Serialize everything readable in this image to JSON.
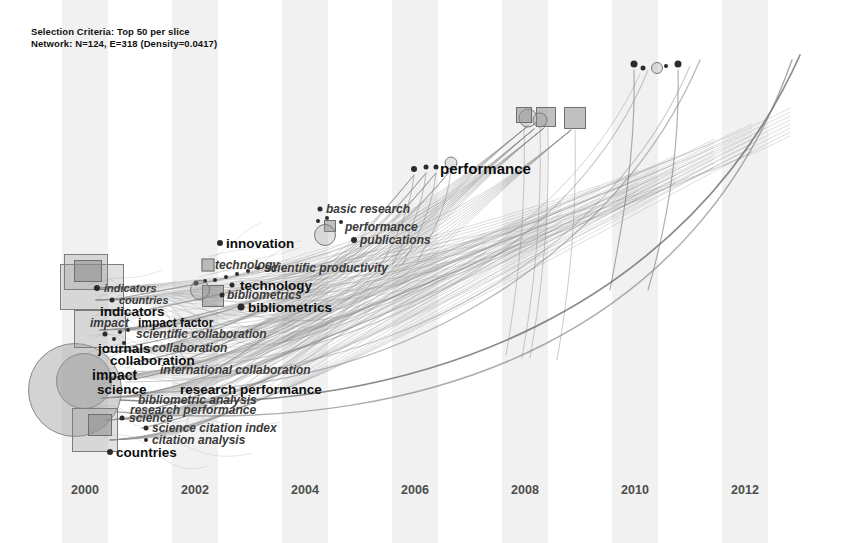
{
  "figure": {
    "kind": "citespace-timeline-network",
    "width": 862,
    "height": 543,
    "background": "#ffffff",
    "band_color": "#f1f1f1",
    "edge_color": "#8c8c8c",
    "node_color": "#8c8c8c",
    "label_color": "#1b1b1b"
  },
  "header": {
    "line1": "Selection Criteria: Top 50 per slice",
    "line2": "Network: N=124, E=318 (Density=0.0417)"
  },
  "chart_data": {
    "type": "scatter",
    "title": "",
    "xlabel": "",
    "ylabel": "",
    "grid": false,
    "legend": "none",
    "xlim": [
      1999,
      2013
    ],
    "axis_years": [
      "2000",
      "2002",
      "2004",
      "2006",
      "2008",
      "2010",
      "2012"
    ],
    "year_x": [
      85,
      195,
      305,
      415,
      525,
      635,
      745
    ],
    "bands": [
      {
        "label": "2000",
        "x": 62,
        "width": 46
      },
      {
        "label": "2002",
        "x": 172,
        "width": 46
      },
      {
        "label": "2004",
        "x": 282,
        "width": 46
      },
      {
        "label": "2006",
        "x": 392,
        "width": 46
      },
      {
        "label": "2008",
        "x": 502,
        "width": 46
      },
      {
        "label": "2010",
        "x": 612,
        "width": 46
      },
      {
        "label": "2012",
        "x": 722,
        "width": 46
      }
    ],
    "labels": [
      {
        "text": "indicators",
        "x": 104,
        "y": 288,
        "size": 11,
        "style": "italic"
      },
      {
        "text": "countries",
        "x": 119,
        "y": 300,
        "size": 11,
        "style": "italic"
      },
      {
        "text": "indicators",
        "x": 100,
        "y": 311,
        "size": 13.5,
        "style": "bold"
      },
      {
        "text": "impact",
        "x": 90,
        "y": 323,
        "size": 12,
        "style": "italic"
      },
      {
        "text": "impact factor",
        "x": 138,
        "y": 323,
        "size": 12,
        "style": "bold"
      },
      {
        "text": "scientific collaboration",
        "x": 136,
        "y": 334,
        "size": 12,
        "style": "italic"
      },
      {
        "text": "journals",
        "x": 98,
        "y": 348,
        "size": 13.5,
        "style": "bold"
      },
      {
        "text": "collaboration",
        "x": 152,
        "y": 348,
        "size": 12,
        "style": "italic"
      },
      {
        "text": "collaboration",
        "x": 110,
        "y": 360,
        "size": 13.5,
        "style": "bold"
      },
      {
        "text": "impact",
        "x": 92,
        "y": 375,
        "size": 14,
        "style": "bold"
      },
      {
        "text": "international collaboration",
        "x": 160,
        "y": 370,
        "size": 12,
        "style": "italic"
      },
      {
        "text": "science",
        "x": 97,
        "y": 389,
        "size": 13.5,
        "style": "bold"
      },
      {
        "text": "research performance",
        "x": 180,
        "y": 389,
        "size": 13.5,
        "style": "bold"
      },
      {
        "text": "bibliometric analysis",
        "x": 138,
        "y": 400,
        "size": 12,
        "style": "italic"
      },
      {
        "text": "research performance",
        "x": 130,
        "y": 410,
        "size": 12,
        "style": "italic"
      },
      {
        "text": "science",
        "x": 129,
        "y": 418,
        "size": 12,
        "style": "italic"
      },
      {
        "text": "science citation index",
        "x": 152,
        "y": 428,
        "size": 12,
        "style": "italic"
      },
      {
        "text": "citation analysis",
        "x": 152,
        "y": 440,
        "size": 12,
        "style": "italic"
      },
      {
        "text": "countries",
        "x": 116,
        "y": 452,
        "size": 13.5,
        "style": "bold"
      },
      {
        "text": "technology",
        "x": 215,
        "y": 265,
        "size": 12,
        "style": "italic"
      },
      {
        "text": "technology",
        "x": 240,
        "y": 285,
        "size": 13.5,
        "style": "bold"
      },
      {
        "text": "bibliometrics",
        "x": 227,
        "y": 295,
        "size": 12,
        "style": "italic"
      },
      {
        "text": "bibliometrics",
        "x": 248,
        "y": 307,
        "size": 13.5,
        "style": "bold"
      },
      {
        "text": "innovation",
        "x": 226,
        "y": 243,
        "size": 13.5,
        "style": "bold"
      },
      {
        "text": "scientific productivity",
        "x": 264,
        "y": 268,
        "size": 12,
        "style": "italic"
      },
      {
        "text": "basic research",
        "x": 326,
        "y": 209,
        "size": 12,
        "style": "italic"
      },
      {
        "text": "performance",
        "x": 345,
        "y": 227,
        "size": 12,
        "style": "italic"
      },
      {
        "text": "publications",
        "x": 360,
        "y": 240,
        "size": 12,
        "style": "italic"
      },
      {
        "text": "performance",
        "x": 440,
        "y": 168,
        "size": 15,
        "style": "bold"
      }
    ],
    "nodes": [
      {
        "shape": "blob",
        "x": 75,
        "y": 390,
        "w": 92,
        "h": 92
      },
      {
        "shape": "blob",
        "x": 84,
        "y": 381,
        "w": 54,
        "h": 54
      },
      {
        "shape": "rect",
        "x": 92,
        "y": 287,
        "w": 62,
        "h": 44
      },
      {
        "shape": "rect",
        "x": 86,
        "y": 272,
        "w": 42,
        "h": 34
      },
      {
        "shape": "sq",
        "x": 88,
        "y": 271,
        "w": 26,
        "h": 20
      },
      {
        "shape": "rect",
        "x": 100,
        "y": 329,
        "w": 50,
        "h": 36
      },
      {
        "shape": "rect",
        "x": 95,
        "y": 430,
        "w": 44,
        "h": 42
      },
      {
        "shape": "sq",
        "x": 100,
        "y": 425,
        "w": 22,
        "h": 20
      },
      {
        "shape": "dot",
        "x": 97,
        "y": 288,
        "w": 6,
        "h": 6
      },
      {
        "shape": "dot",
        "x": 112,
        "y": 300,
        "w": 5,
        "h": 5
      },
      {
        "shape": "dot",
        "x": 105,
        "y": 334,
        "w": 5,
        "h": 5
      },
      {
        "shape": "dot",
        "x": 120,
        "y": 332,
        "w": 4,
        "h": 4
      },
      {
        "shape": "dot",
        "x": 128,
        "y": 330,
        "w": 4,
        "h": 4
      },
      {
        "shape": "dot",
        "x": 114,
        "y": 339,
        "w": 4,
        "h": 4
      },
      {
        "shape": "dot",
        "x": 124,
        "y": 343,
        "w": 4,
        "h": 4
      },
      {
        "shape": "dot",
        "x": 110,
        "y": 452,
        "w": 6,
        "h": 6
      },
      {
        "shape": "dot",
        "x": 146,
        "y": 428,
        "w": 5,
        "h": 5
      },
      {
        "shape": "dot",
        "x": 146,
        "y": 440,
        "w": 4,
        "h": 4
      },
      {
        "shape": "dot",
        "x": 122,
        "y": 418,
        "w": 5,
        "h": 5
      },
      {
        "shape": "sq",
        "x": 208,
        "y": 265,
        "w": 11,
        "h": 11
      },
      {
        "shape": "sq",
        "x": 213,
        "y": 296,
        "w": 20,
        "h": 20
      },
      {
        "shape": "dot",
        "x": 220,
        "y": 243,
        "w": 6,
        "h": 6
      },
      {
        "shape": "dot",
        "x": 241,
        "y": 307,
        "w": 7,
        "h": 7
      },
      {
        "shape": "dot",
        "x": 232,
        "y": 285,
        "w": 5,
        "h": 5
      },
      {
        "shape": "dot",
        "x": 222,
        "y": 295,
        "w": 5,
        "h": 5
      },
      {
        "shape": "dot",
        "x": 196,
        "y": 283,
        "w": 5,
        "h": 5
      },
      {
        "shape": "dot",
        "x": 205,
        "y": 281,
        "w": 4,
        "h": 4
      },
      {
        "shape": "dot",
        "x": 215,
        "y": 280,
        "w": 4,
        "h": 4
      },
      {
        "shape": "dot",
        "x": 226,
        "y": 277,
        "w": 4,
        "h": 4
      },
      {
        "shape": "dot",
        "x": 237,
        "y": 274,
        "w": 4,
        "h": 4
      },
      {
        "shape": "dot",
        "x": 248,
        "y": 271,
        "w": 4,
        "h": 4
      },
      {
        "shape": "dot",
        "x": 258,
        "y": 268,
        "w": 4,
        "h": 4
      },
      {
        "shape": "ring",
        "x": 200,
        "y": 290,
        "w": 18,
        "h": 18
      },
      {
        "shape": "dot",
        "x": 320,
        "y": 209,
        "w": 5,
        "h": 5
      },
      {
        "shape": "sq",
        "x": 330,
        "y": 226,
        "w": 10,
        "h": 10
      },
      {
        "shape": "dot",
        "x": 354,
        "y": 240,
        "w": 6,
        "h": 6
      },
      {
        "shape": "dot",
        "x": 318,
        "y": 221,
        "w": 4,
        "h": 4
      },
      {
        "shape": "dot",
        "x": 327,
        "y": 218,
        "w": 4,
        "h": 4
      },
      {
        "shape": "dot",
        "x": 341,
        "y": 222,
        "w": 4,
        "h": 4
      },
      {
        "shape": "ring",
        "x": 325,
        "y": 235,
        "w": 20,
        "h": 20
      },
      {
        "shape": "dot",
        "x": 414,
        "y": 169,
        "w": 6,
        "h": 6
      },
      {
        "shape": "dot",
        "x": 426,
        "y": 167,
        "w": 5,
        "h": 5
      },
      {
        "shape": "dot",
        "x": 436,
        "y": 167,
        "w": 5,
        "h": 5
      },
      {
        "shape": "ring",
        "x": 451,
        "y": 163,
        "w": 11,
        "h": 11
      },
      {
        "shape": "ring",
        "x": 528,
        "y": 118,
        "w": 17,
        "h": 17
      },
      {
        "shape": "sq",
        "x": 524,
        "y": 115,
        "w": 14,
        "h": 14
      },
      {
        "shape": "sq",
        "x": 546,
        "y": 117,
        "w": 18,
        "h": 18
      },
      {
        "shape": "ring",
        "x": 540,
        "y": 120,
        "w": 13,
        "h": 13
      },
      {
        "shape": "sq",
        "x": 575,
        "y": 118,
        "w": 20,
        "h": 20
      },
      {
        "shape": "dot",
        "x": 634,
        "y": 64,
        "w": 7,
        "h": 7
      },
      {
        "shape": "dot",
        "x": 643,
        "y": 68,
        "w": 5,
        "h": 5
      },
      {
        "shape": "ring",
        "x": 657,
        "y": 68,
        "w": 10,
        "h": 10
      },
      {
        "shape": "dot",
        "x": 666,
        "y": 66,
        "w": 4,
        "h": 4
      },
      {
        "shape": "dot",
        "x": 678,
        "y": 64,
        "w": 7,
        "h": 7
      }
    ]
  }
}
